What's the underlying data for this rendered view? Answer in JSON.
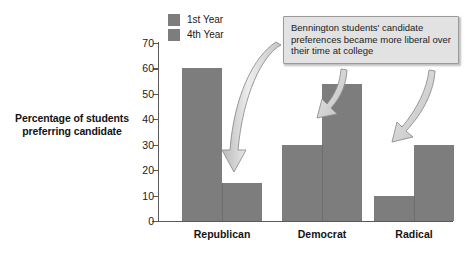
{
  "chart_data": {
    "type": "bar",
    "title": "",
    "subtitle": "",
    "xlabel": "",
    "ylabel": "Percentage of students preferring candidate",
    "categories": [
      "Republican",
      "Democrat",
      "Radical"
    ],
    "series": [
      {
        "name": "1st Year",
        "values": [
          60,
          30,
          10
        ],
        "color": "#7d7d7d"
      },
      {
        "name": "4th Year",
        "values": [
          15,
          54,
          30
        ],
        "color": "#7d7d7d"
      }
    ],
    "ylim": [
      0,
      70
    ],
    "yticks": [
      0,
      10,
      20,
      30,
      40,
      50,
      60,
      70
    ],
    "ytick_labels": [
      "0",
      "10",
      "20",
      "30",
      "40",
      "50",
      "60",
      "70"
    ],
    "grid": false,
    "legend_position": "top-left",
    "annotations": [
      {
        "text": "Bennington students' candidate preferences became more liberal over their time at college",
        "arrows": 3,
        "points_to": [
          "Republican 4th Year",
          "Democrat 4th Year",
          "Radical 4th Year"
        ]
      }
    ]
  },
  "axis": {
    "y_title_line1": "Percentage of students",
    "y_title_line2": "preferring candidate"
  },
  "legend": {
    "items": [
      {
        "label": "1st Year",
        "swatch": "#7d7d7d"
      },
      {
        "label": "4th Year",
        "swatch": "#7d7d7d"
      }
    ]
  },
  "callout": {
    "text": "Bennington students' candidate preferences became more liberal over their time at college",
    "background": "#e2e2e2",
    "border": "#9a9a9a"
  },
  "colors": {
    "bar": "#7d7d7d",
    "bar_edge": "#6e6e6e",
    "axis": "#5a5a5a",
    "text": "#1a1a1a",
    "background": "#ffffff",
    "arrow_fill": "#d8d8d8",
    "arrow_stroke": "#8c8c8c"
  }
}
